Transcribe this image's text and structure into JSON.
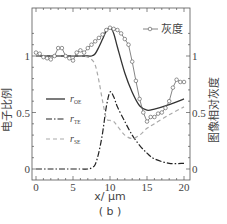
{
  "chart_data": {
    "type": "line",
    "title": "",
    "caption": "( b )",
    "xlabel": "x/ μm",
    "ylabel_left": "电子比例",
    "ylabel_right": "图像相对灰度",
    "xlim": [
      0,
      20
    ],
    "ylim_left": [
      -0.05,
      1.3
    ],
    "ylim_right": [
      -0.05,
      1.3
    ],
    "x_ticks": [
      "0",
      "5",
      "10",
      "15",
      "20"
    ],
    "y_ticks_left": [
      "0",
      "0.5",
      "1"
    ],
    "y_ticks_right": [
      "0",
      "0.5",
      "1"
    ],
    "legend": [
      {
        "label": "r",
        "sub": "OE",
        "style": "solid"
      },
      {
        "label": "r",
        "sub": "TE",
        "style": "dash-dot"
      },
      {
        "label": "r",
        "sub": "SE",
        "style": "dashed-gray"
      },
      {
        "label": "灰度",
        "style": "line-with-circles"
      }
    ],
    "series": [
      {
        "name": "r_OE",
        "axis": "left",
        "x": [
          0,
          2,
          4,
          6,
          7,
          7.5,
          8,
          8.5,
          9,
          9.5,
          10,
          10.5,
          11,
          12,
          13,
          14,
          15,
          16,
          18,
          20
        ],
        "y": [
          1.0,
          1.0,
          1.0,
          1.0,
          1.0,
          1.0,
          1.02,
          1.08,
          1.15,
          1.22,
          1.25,
          1.2,
          1.08,
          0.85,
          0.68,
          0.56,
          0.52,
          0.53,
          0.57,
          0.62
        ]
      },
      {
        "name": "r_TE",
        "axis": "left",
        "x": [
          0,
          2,
          4,
          6,
          7,
          7.5,
          8,
          8.5,
          9,
          9.5,
          10,
          10.5,
          11,
          12,
          13,
          14,
          15,
          16,
          18,
          20
        ],
        "y": [
          0,
          0,
          0,
          0,
          0,
          0.01,
          0.04,
          0.15,
          0.32,
          0.55,
          0.68,
          0.64,
          0.55,
          0.42,
          0.3,
          0.21,
          0.14,
          0.09,
          0.05,
          0.05
        ]
      },
      {
        "name": "r_SE",
        "axis": "left",
        "x": [
          0,
          2,
          4,
          6,
          7,
          7.5,
          8,
          8.5,
          9,
          9.5,
          10,
          10.5,
          11,
          12,
          13,
          14,
          15,
          16,
          18,
          20
        ],
        "y": [
          1.0,
          1.0,
          1.0,
          1.0,
          0.99,
          0.97,
          0.92,
          0.78,
          0.6,
          0.45,
          0.43,
          0.42,
          0.38,
          0.3,
          0.27,
          0.3,
          0.36,
          0.4,
          0.48,
          0.55
        ]
      },
      {
        "name": "灰度",
        "axis": "right",
        "x": [
          0,
          0.5,
          1,
          1.5,
          2,
          2.5,
          3,
          3.5,
          4,
          4.5,
          5,
          5.5,
          6,
          6.5,
          7,
          7.5,
          8,
          8.5,
          9,
          9.5,
          10,
          10.5,
          11,
          11.5,
          12,
          12.5,
          13,
          13.5,
          14,
          14.5,
          15,
          15.5,
          16,
          16.5,
          17,
          17.5,
          18,
          18.5,
          19,
          19.5,
          20
        ],
        "y": [
          1.03,
          1.02,
          0.99,
          0.98,
          0.97,
          1.0,
          1.07,
          1.07,
          1.0,
          0.98,
          0.96,
          1.03,
          1.05,
          1.03,
          1.07,
          1.1,
          1.13,
          1.16,
          1.19,
          1.23,
          1.25,
          1.24,
          1.23,
          1.2,
          1.15,
          1.1,
          0.95,
          0.78,
          0.62,
          0.5,
          0.42,
          0.46,
          0.46,
          0.49,
          0.5,
          0.54,
          0.6,
          0.72,
          0.79,
          0.77,
          0.77
        ]
      }
    ]
  }
}
